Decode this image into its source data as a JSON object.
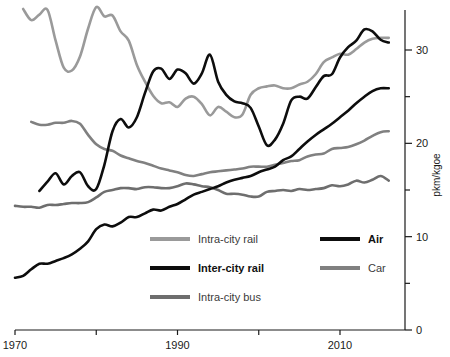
{
  "chart_data": {
    "type": "line",
    "title": "",
    "subtitle": "",
    "xlabel": "",
    "ylabel": "pkm/kgoe",
    "xlim": [
      1970,
      2018
    ],
    "ylim": [
      0,
      34.3
    ],
    "grid": false,
    "legend_position": "inside-bottom-center",
    "x_ticks_major": [
      1970,
      1980,
      1990,
      2000,
      2010
    ],
    "x_tick_labels": [
      "1970",
      "",
      "1990",
      "",
      "2010"
    ],
    "y_ticks_major": [
      0,
      10,
      20,
      30
    ],
    "y_tick_labels": [
      "0",
      "10",
      "20",
      "30"
    ],
    "y_ticks_minor": [
      5,
      15,
      25,
      35
    ],
    "axis_side_y": "right",
    "series": [
      {
        "name": "Intra-city rail",
        "color": "#9a9a9a",
        "width": 2.6,
        "x": [
          1971,
          1972,
          1973,
          1974,
          1975,
          1976,
          1977,
          1978,
          1979,
          1980,
          1981,
          1982,
          1983,
          1984,
          1985,
          1986,
          1987,
          1988,
          1989,
          1990,
          1991,
          1992,
          1993,
          1994,
          1995,
          1996,
          1997,
          1998,
          1999,
          2000,
          2001,
          2002,
          2003,
          2004,
          2005,
          2006,
          2007,
          2008,
          2009,
          2010,
          2011,
          2012,
          2013,
          2014,
          2015,
          2016
        ],
        "values": [
          34.4,
          33.2,
          33.8,
          34.3,
          31.0,
          28.1,
          27.8,
          29.3,
          32.3,
          34.6,
          33.6,
          33.7,
          32.0,
          31.0,
          28.4,
          26.6,
          25.1,
          24.3,
          24.4,
          23.9,
          24.8,
          25.0,
          24.2,
          23.0,
          23.9,
          23.4,
          22.8,
          23.1,
          25.2,
          25.9,
          26.1,
          26.2,
          25.9,
          25.9,
          26.3,
          26.6,
          27.4,
          28.7,
          29.2,
          29.6,
          29.5,
          30.1,
          30.8,
          31.2,
          31.3,
          31.3
        ]
      },
      {
        "name": "Inter-city rail",
        "color": "#0d0d0d",
        "width": 2.6,
        "x": [
          1970,
          1971,
          1972,
          1973,
          1974,
          1975,
          1976,
          1977,
          1978,
          1979,
          1980,
          1981,
          1982,
          1983,
          1984,
          1985,
          1986,
          1987,
          1988,
          1989,
          1990,
          1991,
          1992,
          1993,
          1994,
          1995,
          1996,
          1997,
          1998,
          1999,
          2000,
          2001,
          2002,
          2003,
          2004,
          2005,
          2006,
          2007,
          2008,
          2009,
          2010,
          2011,
          2012,
          2013,
          2014,
          2015,
          2016
        ],
        "values": [
          5.6,
          5.8,
          6.5,
          7.1,
          7.1,
          7.4,
          7.7,
          8.1,
          8.7,
          9.5,
          10.8,
          11.3,
          11.1,
          11.5,
          12.1,
          12.1,
          12.5,
          12.9,
          12.8,
          13.2,
          13.5,
          14.0,
          14.5,
          14.8,
          15.1,
          15.4,
          15.8,
          16.1,
          16.3,
          16.5,
          16.9,
          17.2,
          17.5,
          18.2,
          18.6,
          19.4,
          20.2,
          20.9,
          21.5,
          22.1,
          22.8,
          23.5,
          24.3,
          25.0,
          25.6,
          25.9,
          25.9
        ]
      },
      {
        "name": "Intra-city bus",
        "color": "#6e6e6e",
        "width": 2.6,
        "x": [
          1970,
          1971,
          1972,
          1973,
          1974,
          1975,
          1976,
          1977,
          1978,
          1979,
          1980,
          1981,
          1982,
          1983,
          1984,
          1985,
          1986,
          1987,
          1988,
          1989,
          1990,
          1991,
          1992,
          1993,
          1994,
          1995,
          1996,
          1997,
          1998,
          1999,
          2000,
          2001,
          2002,
          2003,
          2004,
          2005,
          2006,
          2007,
          2008,
          2009,
          2010,
          2011,
          2012,
          2013,
          2014,
          2015,
          2016
        ],
        "values": [
          13.3,
          13.2,
          13.2,
          13.1,
          13.4,
          13.4,
          13.5,
          13.6,
          13.6,
          13.7,
          14.2,
          14.8,
          15.0,
          15.2,
          15.2,
          15.1,
          15.3,
          15.3,
          15.2,
          15.2,
          15.4,
          15.7,
          15.6,
          15.4,
          15.3,
          15.0,
          14.6,
          14.6,
          14.5,
          14.3,
          14.3,
          14.8,
          14.9,
          15.0,
          14.9,
          15.1,
          15.0,
          15.1,
          15.2,
          15.5,
          15.4,
          15.6,
          16.0,
          15.8,
          16.1,
          16.5,
          16.0
        ]
      },
      {
        "name": "Air",
        "color": "#0d0d0d",
        "width": 2.6,
        "x": [
          1973,
          1974,
          1975,
          1976,
          1977,
          1978,
          1979,
          1980,
          1981,
          1982,
          1983,
          1984,
          1985,
          1986,
          1987,
          1988,
          1989,
          1990,
          1991,
          1992,
          1993,
          1994,
          1995,
          1996,
          1997,
          1998,
          1999,
          2000,
          2001,
          2002,
          2003,
          2004,
          2005,
          2006,
          2007,
          2008,
          2009,
          2010,
          2011,
          2012,
          2013,
          2014,
          2015,
          2016
        ],
        "values": [
          14.9,
          15.9,
          16.8,
          15.6,
          16.5,
          16.9,
          15.4,
          15.1,
          17.7,
          21.3,
          22.6,
          21.7,
          22.8,
          25.4,
          27.7,
          28.0,
          26.9,
          27.9,
          27.5,
          26.4,
          27.5,
          29.5,
          26.6,
          25.2,
          24.5,
          24.3,
          23.8,
          21.8,
          19.8,
          20.4,
          22.1,
          24.6,
          25.0,
          24.8,
          26.0,
          27.2,
          27.4,
          29.2,
          30.3,
          31.0,
          32.2,
          32.0,
          31.1,
          30.8
        ]
      },
      {
        "name": "Car",
        "color": "#808080",
        "width": 2.6,
        "x": [
          1972,
          1973,
          1974,
          1975,
          1976,
          1977,
          1978,
          1979,
          1980,
          1981,
          1982,
          1983,
          1984,
          1985,
          1986,
          1987,
          1988,
          1989,
          1990,
          1991,
          1992,
          1993,
          1994,
          1995,
          1996,
          1997,
          1998,
          1999,
          2000,
          2001,
          2002,
          2003,
          2004,
          2005,
          2006,
          2007,
          2008,
          2009,
          2010,
          2011,
          2012,
          2013,
          2014,
          2015,
          2016
        ],
        "values": [
          22.3,
          22.0,
          22.0,
          22.2,
          22.2,
          22.4,
          22.1,
          20.9,
          19.9,
          19.4,
          19.2,
          18.7,
          18.4,
          18.1,
          17.9,
          17.6,
          17.3,
          17.1,
          16.9,
          16.6,
          16.5,
          16.7,
          16.9,
          17.0,
          17.1,
          17.2,
          17.3,
          17.5,
          17.5,
          17.5,
          17.7,
          17.9,
          18.1,
          18.2,
          18.6,
          18.8,
          18.9,
          19.4,
          19.5,
          19.6,
          19.9,
          20.3,
          20.8,
          21.2,
          21.3
        ]
      }
    ]
  },
  "axes": {
    "y_title": "pkm/kgoe",
    "y_labels": [
      "30",
      "20",
      "10",
      "0"
    ],
    "x_labels": [
      "1970",
      "1990",
      "2010"
    ]
  },
  "legend": {
    "items": [
      {
        "label": "Intra-city rail",
        "color": "#9a9a9a",
        "emphasis": "light"
      },
      {
        "label": "Inter-city rail",
        "color": "#0d0d0d",
        "emphasis": "dark"
      },
      {
        "label": "Intra-city bus",
        "color": "#6e6e6e",
        "emphasis": "light"
      },
      {
        "label": "Air",
        "color": "#0d0d0d",
        "emphasis": "dark"
      },
      {
        "label": "Car",
        "color": "#808080",
        "emphasis": "light"
      }
    ]
  }
}
